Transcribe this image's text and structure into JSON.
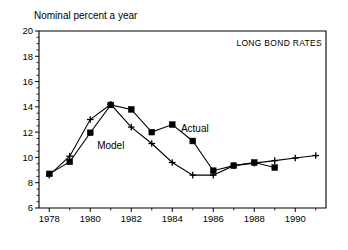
{
  "chart_data": {
    "type": "line",
    "title": "",
    "ylabel": "Nominal percent a year",
    "xlabel": "",
    "annotation": "LONG BOND RATES",
    "xlim": [
      1977.5,
      1991.5
    ],
    "ylim": [
      6,
      20
    ],
    "ytick_labels": [
      "6",
      "8",
      "10",
      "12",
      "14",
      "16",
      "18",
      "20"
    ],
    "ytick_values": [
      6,
      8,
      10,
      12,
      14,
      16,
      18,
      20
    ],
    "ytick_minor_step": 0.5,
    "xtick_labels": [
      "1978",
      "1980",
      "1982",
      "1984",
      "1986",
      "1988",
      "1990"
    ],
    "xtick_values": [
      1978,
      1980,
      1982,
      1984,
      1986,
      1988,
      1990
    ],
    "xtick_minor_values": [
      1979,
      1981,
      1983,
      1985,
      1987,
      1989,
      1991
    ],
    "grid": false,
    "legend_position": "inline-annotations",
    "series": [
      {
        "name": "Actual",
        "marker": "square",
        "label_x": 1985.1,
        "label_y": 12.0,
        "x": [
          1978,
          1979,
          1980,
          1981,
          1982,
          1983,
          1984,
          1985,
          1986,
          1987,
          1988,
          1989
        ],
        "values": [
          8.7,
          9.65,
          11.95,
          14.15,
          13.8,
          12.0,
          12.6,
          11.3,
          8.95,
          9.35,
          9.6,
          9.2
        ]
      },
      {
        "name": "Model",
        "marker": "plus",
        "label_x": 1981.0,
        "label_y": 10.7,
        "x": [
          1978,
          1979,
          1980,
          1981,
          1982,
          1983,
          1984,
          1985,
          1986,
          1987,
          1988,
          1989,
          1990,
          1991
        ],
        "values": [
          8.6,
          10.1,
          13.0,
          14.2,
          12.4,
          11.1,
          9.6,
          8.6,
          8.6,
          9.35,
          9.55,
          9.75,
          9.95,
          10.15
        ]
      }
    ]
  }
}
